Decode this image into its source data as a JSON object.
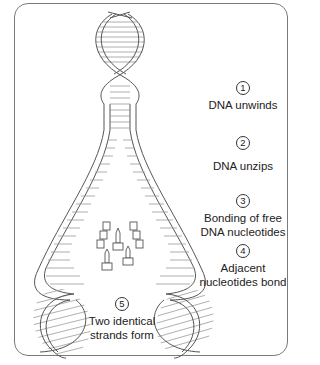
{
  "diagram": {
    "colors": {
      "stroke": "#555555",
      "rung": "#9a9a9a",
      "frame": "#7a7a7a",
      "text": "#222222"
    },
    "steps": [
      {
        "number": "1",
        "text": "DNA unwinds"
      },
      {
        "number": "2",
        "text": "DNA unzips"
      },
      {
        "number": "3",
        "text": "Bonding of free DNA nucleotides",
        "lines": [
          "Bonding of free",
          "DNA nucleotides"
        ]
      },
      {
        "number": "4",
        "text": "Adjacent nucleotides bond",
        "lines": [
          "Adjacent",
          "nucleotides bond"
        ]
      },
      {
        "number": "5",
        "text": "Two identical strands form",
        "lines": [
          "Two identical",
          "strands form"
        ]
      }
    ]
  }
}
